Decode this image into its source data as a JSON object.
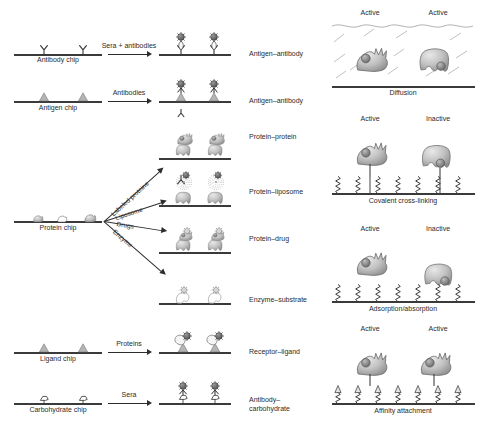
{
  "figure": {
    "type": "scientific-schematic"
  },
  "left_panel": {
    "name": "chip-workflow-panel",
    "rows": [
      {
        "id": "antibody",
        "chip_label": "Antibody chip",
        "chip_icon": "antibody-y-shape",
        "arrow_label": "Sera + antibodies",
        "result_label": "Antigen–antibody",
        "result_icon": "antibody-antigen-complex"
      },
      {
        "id": "antigen",
        "chip_label": "Antigen chip",
        "chip_icon": "antigen-triangle",
        "arrow_label": "Antibodies",
        "result_label": "Antigen–antibody",
        "result_icon": "antigen-antibody-complex"
      },
      {
        "id": "protein",
        "chip_label": "Protein chip",
        "chip_icon": "protein-blobs"
      }
    ],
    "protein_branches": [
      {
        "id": "labeled-proteins",
        "arrow_label": "Labeled proteins",
        "result_label": "Protein–protein",
        "result_icon": "protein-protein-complex"
      },
      {
        "id": "liposome",
        "arrow_label": "Liposome",
        "result_label": "Protein–liposome",
        "result_icon": "protein-liposome-complex"
      },
      {
        "id": "drugs",
        "arrow_label": "Drugs",
        "result_label": "Protein–drug",
        "result_icon": "protein-drug-complex"
      },
      {
        "id": "enzyme",
        "arrow_label": "Enzyme",
        "result_label": "Enzyme–substrate",
        "result_icon": "enzyme-substrate-complex"
      }
    ],
    "lower_rows": [
      {
        "id": "ligand",
        "chip_label": "Ligand chip",
        "chip_icon": "ligand-triangle",
        "arrow_label": "Proteins",
        "result_label": "Receptor–ligand",
        "result_icon": "receptor-ligand-complex"
      },
      {
        "id": "carbohydrate",
        "chip_label": "Carbohydrate chip",
        "chip_icon": "carbohydrate-outline",
        "arrow_label": "Sera",
        "result_label": "Antibody–\ncarbohydrate",
        "result_icon": "antibody-carbohydrate-complex"
      }
    ]
  },
  "right_panel": {
    "name": "immobilization-methods-panel",
    "methods": [
      {
        "id": "diffusion",
        "caption": "Diffusion",
        "states": [
          "Active",
          "Active"
        ],
        "linker_icon": "none-free-solution",
        "decoration": "wavy-solution-lines"
      },
      {
        "id": "covalent-cross-linking",
        "caption": "Covalent cross-linking",
        "states": [
          "Active",
          "Inactive"
        ],
        "linker_icon": "zigzag-chain",
        "decoration": "zigzag-brush"
      },
      {
        "id": "adsorption-absorption",
        "caption": "Adsorption/absorption",
        "states": [
          "Active",
          "Inactive"
        ],
        "linker_icon": "zigzag-chain",
        "decoration": "zigzag-brush"
      },
      {
        "id": "affinity-attachment",
        "caption": "Affinity attachment",
        "states": [
          "Active",
          "Active"
        ],
        "linker_icon": "zigzag-with-arrowhead-tag",
        "decoration": "zigzag-brush-tagged"
      }
    ]
  },
  "colors": {
    "surface_line": "#3a3a3a",
    "arrow": "#2d2d2d",
    "protein_fill": "#b9b9b9",
    "protein_dark": "#8a8a8a",
    "antigen_dark": "#4a4a4a",
    "text": "#2b2b2b",
    "background": "#ffffff"
  }
}
